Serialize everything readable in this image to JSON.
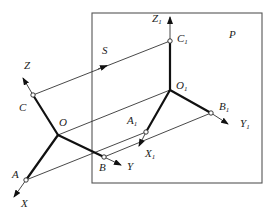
{
  "diagram": {
    "plane_label": "P",
    "direction_label": "S",
    "origin_axes": {
      "origin": "O",
      "x_axis": "X",
      "y_axis": "Y",
      "z_axis": "Z",
      "points": [
        "A",
        "B",
        "C"
      ]
    },
    "projected_axes": {
      "origin": "O",
      "origin_sub": "1",
      "x_axis": "X",
      "x_sub": "1",
      "y_axis": "Y",
      "y_sub": "1",
      "z_axis": "Z",
      "z_sub": "1",
      "points": [
        {
          "name": "A",
          "sub": "1"
        },
        {
          "name": "B",
          "sub": "1"
        },
        {
          "name": "C",
          "sub": "1"
        }
      ]
    },
    "colors": {
      "line": "#111111",
      "frame": "#555555",
      "background": "#ffffff"
    }
  }
}
